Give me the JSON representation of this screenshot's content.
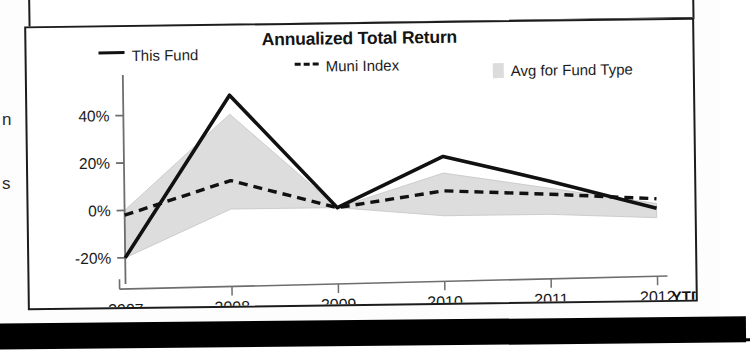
{
  "chart_title": "Annualized Total Return",
  "legend": {
    "this_fund": "This Fund",
    "muni_index": "Muni Index",
    "avg_fund_type": "Avg for Fund Type"
  },
  "axis": {
    "y_ticks": [
      "40%",
      "20%",
      "0%",
      "-20%"
    ],
    "x_ticks": [
      "2007",
      "2008",
      "2009",
      "2010",
      "2011",
      "2012"
    ],
    "ytd_suffix": "YTD"
  },
  "edge_fragments": {
    "frag_one": "n",
    "frag_two": "s"
  },
  "colors": {
    "line": "#111111",
    "area_fill": "#dddddd",
    "axis": "#6e6e6e",
    "border": "#1c1c1c",
    "band": "#000000"
  },
  "chart_data": {
    "type": "line",
    "title": "Annualized Total Return",
    "xlabel": "",
    "ylabel": "",
    "ylim": [
      -26,
      52
    ],
    "grid": false,
    "legend_position": "top",
    "categories": [
      "2007",
      "2008",
      "2009",
      "2010",
      "2011",
      "2012 YTD"
    ],
    "series": [
      {
        "name": "This Fund",
        "style": "solid",
        "values": [
          -20,
          48,
          0,
          21,
          10,
          -2
        ]
      },
      {
        "name": "Muni Index",
        "style": "dashed",
        "values": [
          -2,
          12,
          0,
          6.5,
          4.5,
          2
        ]
      },
      {
        "name": "Avg for Fund Type",
        "style": "shaded-band",
        "upper_values": [
          0,
          40,
          0,
          14,
          7,
          0
        ],
        "lower_values": [
          -20,
          0,
          0,
          -4,
          -4,
          -6
        ]
      }
    ]
  }
}
